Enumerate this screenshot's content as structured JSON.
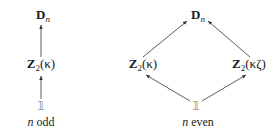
{
  "diagrams": [
    {
      "caption": "n odd",
      "caption_n": "n",
      "caption_rest": " odd",
      "nodes": {
        "top": {
          "main": "D",
          "sub": "n"
        },
        "middle": {
          "main": "Z",
          "sub": "2",
          "arg": "(κ)"
        },
        "bottom": {
          "main": "𝟙"
        }
      },
      "arrows": [
        {
          "from": "bottom",
          "to": "middle"
        },
        {
          "from": "middle",
          "to": "top"
        }
      ]
    },
    {
      "caption": "n even",
      "caption_n": "n",
      "caption_rest": " even",
      "nodes": {
        "top": {
          "main": "D",
          "sub": "n"
        },
        "left": {
          "main": "Z",
          "sub": "2",
          "arg": "(κ)"
        },
        "right": {
          "main": "Z",
          "sub": "2",
          "arg": "(κζ)"
        },
        "bottom": {
          "main": "𝟙"
        }
      },
      "arrows": [
        {
          "from": "bottom",
          "to": "left"
        },
        {
          "from": "bottom",
          "to": "right"
        },
        {
          "from": "left",
          "to": "top"
        },
        {
          "from": "right",
          "to": "top"
        }
      ]
    }
  ],
  "colors": {
    "text": "#1a1a1a",
    "arrow": "#333333",
    "one": "#7a7a7a"
  }
}
